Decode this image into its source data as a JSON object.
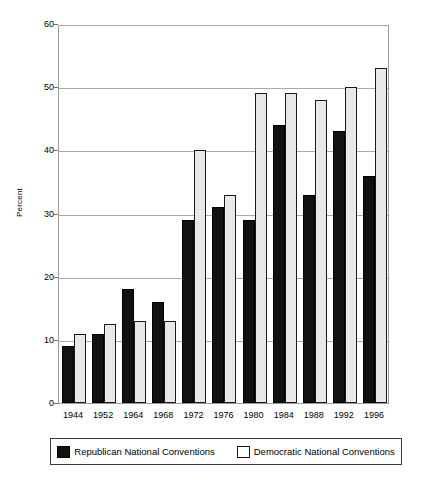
{
  "chart_data": {
    "type": "bar",
    "title": "",
    "xlabel": "",
    "ylabel": "Percent",
    "ylim": [
      0,
      60
    ],
    "yticks": [
      0,
      10,
      20,
      30,
      40,
      50,
      60
    ],
    "grid": true,
    "legend_position": "bottom",
    "categories": [
      "1944",
      "1952",
      "1964",
      "1968",
      "1972",
      "1976",
      "1980",
      "1984",
      "1988",
      "1992",
      "1996"
    ],
    "series": [
      {
        "name": "Republican National Conventions",
        "color": "#111111",
        "values": [
          9,
          11,
          18,
          16,
          29,
          31,
          29,
          44,
          33,
          43,
          36
        ]
      },
      {
        "name": "Democratic National Conventions",
        "color": "#e8e8e8",
        "values": [
          11,
          12.5,
          13,
          13,
          40,
          33,
          49,
          49,
          48,
          50,
          53
        ]
      }
    ]
  },
  "legend": {
    "entries": [
      {
        "label": "Republican National Conventions",
        "swatch": "rep"
      },
      {
        "label": "Democratic National Conventions",
        "swatch": "dem"
      }
    ]
  }
}
